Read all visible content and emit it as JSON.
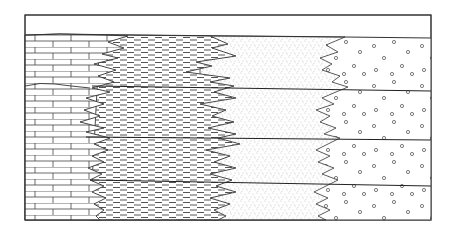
{
  "diagram": {
    "type": "geological-cross-section",
    "description": "Lateral facies change with intertonguing boundaries between four lithologies, crossed by bedding surfaces",
    "frame": {
      "x": 25,
      "y": 15,
      "width": 406,
      "height": 205,
      "stroke": "#333333"
    },
    "strata_top_y_left": 35,
    "strata_top_y_right": 38,
    "bedding_surfaces": [
      {
        "name": "surface-1",
        "y_left": 86,
        "y_right": 91
      },
      {
        "name": "surface-2",
        "y_left": 137,
        "y_right": 140
      },
      {
        "name": "surface-3",
        "y_left": 180,
        "y_right": 186
      }
    ],
    "facies": [
      {
        "name": "limestone",
        "pattern": "brick",
        "order": 1
      },
      {
        "name": "shale",
        "pattern": "dashes",
        "order": 2
      },
      {
        "name": "sandstone",
        "pattern": "stipple",
        "order": 3
      },
      {
        "name": "conglomerate",
        "pattern": "circles",
        "order": 4
      }
    ],
    "colors": {
      "line": "#333333",
      "fill": "#ffffff",
      "stipple": "#9a9a9a"
    }
  }
}
